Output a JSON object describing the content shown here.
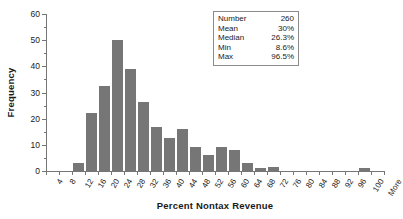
{
  "chart_data": {
    "type": "bar",
    "title": "",
    "xlabel": "Percent Nontax Revenue",
    "ylabel": "Frequency",
    "ylim": [
      0,
      60
    ],
    "ytick_labels": [
      "0",
      "10",
      "20",
      "30",
      "40",
      "50",
      "60"
    ],
    "ytick_values": [
      0,
      10,
      20,
      30,
      40,
      50,
      60
    ],
    "yminor_step": 5,
    "grid": false,
    "legend": "none",
    "bar_color": "#767676",
    "axis_color": "#767676",
    "categories": [
      "4",
      "8",
      "12",
      "16",
      "20",
      "24",
      "28",
      "32",
      "36",
      "40",
      "44",
      "48",
      "52",
      "56",
      "60",
      "64",
      "68",
      "72",
      "76",
      "80",
      "84",
      "88",
      "92",
      "96",
      "100",
      "More"
    ],
    "values": [
      0,
      0,
      3,
      22,
      32.5,
      50,
      39,
      26.5,
      17,
      12.5,
      16,
      9,
      6,
      9,
      8,
      3,
      1,
      1.5,
      0,
      0,
      0,
      0,
      0,
      0,
      1,
      0
    ]
  },
  "stats_box": {
    "rows": [
      {
        "key": "Number",
        "value": "260"
      },
      {
        "key": "Mean",
        "value": "30%"
      },
      {
        "key": "Median",
        "value": "26.3%"
      },
      {
        "key": "Min",
        "value": "8.6%"
      },
      {
        "key": "Max",
        "value": "96.5%"
      }
    ]
  }
}
